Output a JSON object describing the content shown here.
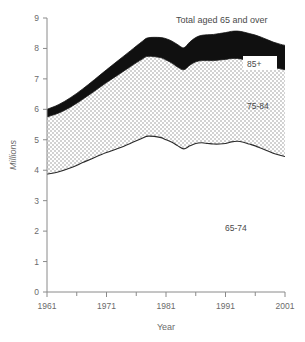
{
  "chart_data": {
    "type": "area",
    "title": "Total aged 65 and over",
    "xlabel": "Year",
    "ylabel": "Millions",
    "xlim": [
      1961,
      2001
    ],
    "ylim": [
      0,
      9
    ],
    "grid": false,
    "legend_position": "inline-annotations",
    "xticks": [
      1961,
      1971,
      1981,
      1991,
      2001
    ],
    "xtick_labels": [
      "1961",
      "1971",
      "1981",
      "1991",
      "2001"
    ],
    "minor_xticks": [
      1966,
      1976,
      1986,
      1996
    ],
    "yticks": [
      0,
      1,
      2,
      3,
      4,
      5,
      6,
      7,
      8,
      9
    ],
    "ytick_labels": [
      "0",
      "1",
      "2",
      "3",
      "4",
      "5",
      "6",
      "7",
      "8",
      "9"
    ],
    "stacked": true,
    "x": [
      1961,
      1963,
      1965,
      1967,
      1969,
      1971,
      1973,
      1975,
      1977,
      1978,
      1980,
      1981,
      1982,
      1983,
      1984,
      1985,
      1986,
      1987,
      1988,
      1989,
      1990,
      1991,
      1992,
      1993,
      1994,
      1995,
      1996,
      1997,
      1998,
      1999,
      2000,
      2001
    ],
    "series": [
      {
        "name": "65-74",
        "label": "65-74",
        "fill": "#ffffff",
        "values": [
          3.87,
          3.95,
          4.08,
          4.25,
          4.42,
          4.58,
          4.72,
          4.88,
          5.05,
          5.12,
          5.08,
          5.0,
          4.92,
          4.8,
          4.7,
          4.8,
          4.88,
          4.9,
          4.88,
          4.86,
          4.86,
          4.88,
          4.93,
          4.95,
          4.92,
          4.86,
          4.8,
          4.72,
          4.64,
          4.56,
          4.5,
          4.45
        ]
      },
      {
        "name": "75-84",
        "label": "75-84",
        "fill": "#d8d8d8",
        "values": [
          1.88,
          1.93,
          2.0,
          2.08,
          2.18,
          2.3,
          2.42,
          2.52,
          2.6,
          2.62,
          2.62,
          2.62,
          2.6,
          2.58,
          2.6,
          2.65,
          2.68,
          2.7,
          2.72,
          2.74,
          2.76,
          2.76,
          2.74,
          2.72,
          2.72,
          2.74,
          2.76,
          2.78,
          2.8,
          2.82,
          2.84,
          2.85
        ]
      },
      {
        "name": "85+",
        "label": "85+",
        "fill": "#101010",
        "values": [
          0.25,
          0.28,
          0.31,
          0.34,
          0.38,
          0.42,
          0.47,
          0.52,
          0.58,
          0.61,
          0.66,
          0.7,
          0.72,
          0.74,
          0.72,
          0.76,
          0.8,
          0.83,
          0.85,
          0.86,
          0.87,
          0.88,
          0.89,
          0.9,
          0.9,
          0.89,
          0.88,
          0.87,
          0.85,
          0.83,
          0.81,
          0.8
        ]
      }
    ],
    "totals": [
      6.0,
      6.16,
      6.39,
      6.67,
      6.98,
      7.3,
      7.61,
      7.92,
      8.23,
      8.35,
      8.36,
      8.32,
      8.24,
      8.12,
      8.02,
      8.21,
      8.36,
      8.43,
      8.45,
      8.46,
      8.49,
      8.52,
      8.56,
      8.57,
      8.54,
      8.49,
      8.44,
      8.37,
      8.29,
      8.21,
      8.15,
      8.1
    ],
    "colors": {
      "band_65_74": "#ffffff",
      "band_75_84": "#d8d8d8",
      "band_85_plus": "#101010",
      "axis": "#8a8a8a",
      "text": "#5a5a5a"
    }
  }
}
